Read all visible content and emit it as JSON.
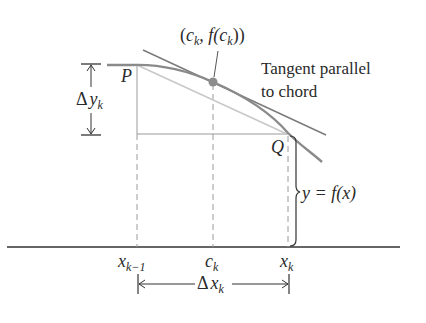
{
  "figure": {
    "point_labels": {
      "P": "P",
      "Q": "Q",
      "tangent_point": {
        "open": "(",
        "c": "c",
        "c_sub": "k",
        "comma_f": ", f(",
        "c2": "c",
        "c2_sub": "k",
        "close": "))"
      }
    },
    "annotations": {
      "tangent_line1": "Tangent parallel",
      "tangent_line2": "to chord",
      "curve_label": "y = f(x)",
      "delta_y": {
        "delta": "Δ",
        "var": "y",
        "sub": "k"
      },
      "delta_x": {
        "delta": "Δ",
        "var": "x",
        "sub": "k"
      }
    },
    "axis_ticks": [
      {
        "var": "x",
        "sub": "k−1"
      },
      {
        "var": "c",
        "sub": "k"
      },
      {
        "var": "x",
        "sub": "k"
      }
    ],
    "colors": {
      "curve": "#8a8a8a",
      "tangent": "#7a7a7a",
      "chord": "#c8c8c8",
      "axis": "#333333",
      "dashed": "#9a9a9a",
      "point": "#8c8c8c"
    }
  }
}
